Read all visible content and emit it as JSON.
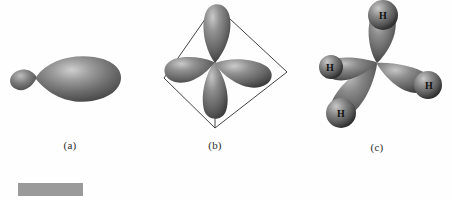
{
  "figure": {
    "type": "scientific-illustration",
    "background_color": "#fefefe",
    "panels": [
      {
        "id": "a",
        "caption": "(a)",
        "description": "single sp3 hybrid orbital with small back lobe and large front lobe",
        "lobe_count": 2
      },
      {
        "id": "b",
        "caption": "(b)",
        "description": "four sp3 hybrid orbitals directed toward the corners of a tetrahedron",
        "lobe_count": 4,
        "wireframe": "tetrahedron"
      },
      {
        "id": "c",
        "caption": "(c)",
        "description": "methane molecule formed from four sp3 orbitals overlapping hydrogen 1s orbitals",
        "atom_labels": [
          "H",
          "H",
          "H",
          "H"
        ]
      }
    ]
  },
  "colors": {
    "orbital_dark": "#4a4a4a",
    "orbital_mid": "#6e6e6e",
    "orbital_light": "#b4b4b4",
    "orbital_highlight": "#d6d6d6",
    "atom_dark": "#3e3e3e",
    "atom_light": "#c8c8c8",
    "outline": "#2b2b2b",
    "gray_bar": "#9a9a9a",
    "text": "#1a1a1a"
  },
  "gray_bar": {
    "label": "",
    "color": "#9a9a9a"
  }
}
